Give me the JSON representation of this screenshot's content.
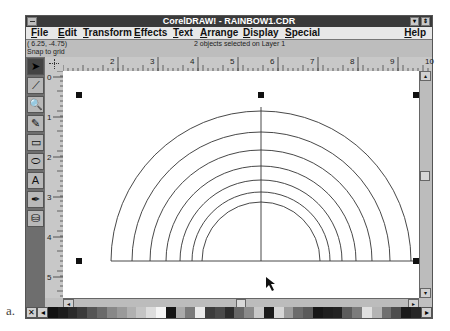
{
  "figure_label": "a.",
  "window": {
    "title": "CorelDRAW! - RAINBOW1.CDR",
    "minimize_glyph": "▾",
    "maximize_glyph": "⇕"
  },
  "menu": {
    "items": [
      {
        "label": "File",
        "x": 5
      },
      {
        "label": "Edit",
        "x": 32
      },
      {
        "label": "Transform",
        "x": 57
      },
      {
        "label": "Effects",
        "x": 108
      },
      {
        "label": "Text",
        "x": 147
      },
      {
        "label": "Arrange",
        "x": 174
      },
      {
        "label": "Display",
        "x": 217
      },
      {
        "label": "Special",
        "x": 259
      }
    ],
    "help": "Help"
  },
  "status": {
    "coords": "( 6.25, -4.75)",
    "snap": "Snap to grid",
    "selection": "2 objects selected on Layer 1"
  },
  "rulers": {
    "horizontal": [
      {
        "label": "2",
        "x": 47
      },
      {
        "label": "3",
        "x": 87
      },
      {
        "label": "4",
        "x": 127
      },
      {
        "label": "5",
        "x": 167
      },
      {
        "label": "6",
        "x": 207
      },
      {
        "label": "7",
        "x": 247
      },
      {
        "label": "8",
        "x": 287
      },
      {
        "label": "9",
        "x": 327
      },
      {
        "label": "10",
        "x": 362
      }
    ],
    "vertical": [
      {
        "label": "0",
        "y": 0
      },
      {
        "label": "1",
        "y": 40
      },
      {
        "label": "2",
        "y": 80
      },
      {
        "label": "3",
        "y": 120
      },
      {
        "label": "4",
        "y": 160
      },
      {
        "label": "5",
        "y": 200
      }
    ]
  },
  "toolbox": {
    "tools": [
      {
        "name": "pick-tool",
        "glyph": "➤",
        "active": true
      },
      {
        "name": "shape-tool",
        "glyph": "⟋",
        "active": false
      },
      {
        "name": "zoom-tool",
        "glyph": "🔍",
        "active": false
      },
      {
        "name": "pencil-tool",
        "glyph": "✎",
        "active": false
      },
      {
        "name": "rectangle-tool",
        "glyph": "▭",
        "active": false
      },
      {
        "name": "ellipse-tool",
        "glyph": "⬭",
        "active": false
      },
      {
        "name": "text-tool",
        "glyph": "A",
        "active": false
      },
      {
        "name": "outline-tool",
        "glyph": "✒",
        "active": false
      },
      {
        "name": "fill-tool",
        "glyph": "⛁",
        "active": false
      }
    ]
  },
  "drawing": {
    "center_x": 198,
    "baseline_y": 190,
    "radii": [
      150,
      129,
      111,
      95,
      81,
      69,
      59
    ],
    "stroke": "#333333",
    "handles": [
      [
        16,
        24
      ],
      [
        198,
        24
      ],
      [
        353,
        24
      ],
      [
        16,
        190
      ],
      [
        353,
        190
      ]
    ]
  },
  "scroll": {
    "up_glyph": "▴",
    "down_glyph": "▾",
    "left_glyph": "◂",
    "right_glyph": "▸"
  },
  "palette": {
    "none_glyph": "✕",
    "scroll_glyph": "◂",
    "colors": [
      "#111111",
      "#1c1c1c",
      "#2a2a2a",
      "#3a3a3a",
      "#555555",
      "#6a6a6a",
      "#888888",
      "#9a9a9a",
      "#b0b0b0",
      "#c4c4c4",
      "#dcdcdc",
      "#f4f4f4",
      "#141414",
      "#aaaaaa",
      "#7a7a7a",
      "#eaeaea",
      "#3c3c3c",
      "#4a4a4a",
      "#2c2c2c",
      "#666666",
      "#8a8a8a",
      "#c8c8c8",
      "#1a1a1a",
      "#d6d6d6",
      "#9c9c9c",
      "#6c6c6c",
      "#5a5a5a",
      "#161616",
      "#1e1e1e",
      "#222222",
      "#5c5c5c",
      "#7c7c7c",
      "#e0e0e0",
      "#b4b4b4",
      "#707070",
      "#4e4e4e",
      "#1a1a1a",
      "#262626"
    ]
  }
}
